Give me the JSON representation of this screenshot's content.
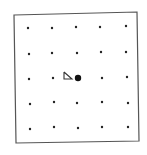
{
  "diagram": {
    "frame": {
      "corners": [
        [
          14,
          15
        ],
        [
          137,
          12
        ],
        [
          139,
          141
        ],
        [
          16,
          143
        ]
      ],
      "stroke": "#555555"
    },
    "grid": {
      "rows": 5,
      "cols": 5,
      "dot_color": "#222222",
      "points": [
        [
          [
            28,
            28
          ],
          [
            52,
            28
          ],
          [
            76,
            27
          ],
          [
            100,
            27
          ],
          [
            126,
            26
          ]
        ],
        [
          [
            29,
            54
          ],
          [
            52,
            53
          ],
          [
            77,
            53
          ],
          [
            101,
            52
          ],
          [
            126,
            52
          ]
        ],
        [
          [
            29,
            79
          ],
          [
            53,
            78
          ],
          [
            78,
            78
          ],
          [
            102,
            78
          ],
          [
            127,
            77
          ]
        ],
        [
          [
            30,
            104
          ],
          [
            54,
            102
          ],
          [
            77,
            103
          ],
          [
            102,
            102
          ],
          [
            128,
            103
          ]
        ],
        [
          [
            30,
            129
          ],
          [
            54,
            127
          ],
          [
            78,
            128
          ],
          [
            102,
            127
          ],
          [
            128,
            127
          ]
        ]
      ]
    },
    "center_marker": {
      "x": 78,
      "y": 78,
      "radius": 3.2,
      "color": "#111111"
    },
    "viewer_glyph": {
      "shape": "triangle",
      "points": [
        [
          64,
          72
        ],
        [
          64,
          79
        ],
        [
          72,
          79
        ]
      ],
      "stroke": "#333333"
    }
  }
}
